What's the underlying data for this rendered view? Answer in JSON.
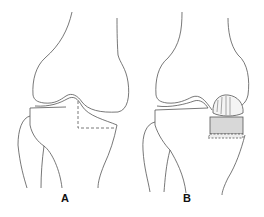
{
  "figure": {
    "panels": [
      {
        "label": "A",
        "description": "Knee joint with dashed outline of tibial plateau defect"
      },
      {
        "label": "B",
        "description": "Knee joint with osteochondral graft filling tibial plateau defect"
      }
    ],
    "colors": {
      "line": "#555555",
      "graft_fill": "#d8d8d8"
    }
  }
}
